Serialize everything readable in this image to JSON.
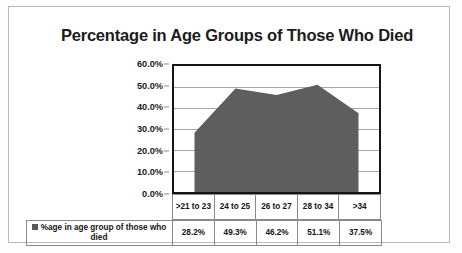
{
  "chart": {
    "title": "Percentage in Age Groups of Those Who Died",
    "legend_label": "%age in age group of those who died",
    "legend_swatch_color": "#5a5a5a",
    "area_fill_color": "#5e5e5e",
    "plot_border_color": "#151515",
    "gridline_color": "#a8a8a8"
  },
  "chart_data": {
    "type": "area",
    "title": "Percentage in Age Groups of Those Who Died",
    "xlabel": "",
    "ylabel": "",
    "categories": [
      ">21 to 23",
      "24 to 25",
      "26 to 27",
      "28 to 34",
      ">34"
    ],
    "values": [
      28.2,
      49.3,
      46.2,
      51.1,
      37.5
    ],
    "value_labels": [
      "28.2%",
      "49.3%",
      "46.2%",
      "51.1%",
      "37.5%"
    ],
    "series": [
      {
        "name": "%age in age group of those who died",
        "values": [
          28.2,
          49.3,
          46.2,
          51.1,
          37.5
        ]
      }
    ],
    "ylim": [
      0,
      60
    ],
    "ytick_labels": [
      "60.0%",
      "50.0%",
      "40.0%",
      "30.0%",
      "20.0%",
      "10.0%",
      "0.0%"
    ],
    "ytick_values": [
      60,
      50,
      40,
      30,
      20,
      10,
      0
    ],
    "grid": true,
    "legend_position": "data-table-bottom",
    "has_data_table": true
  },
  "ticks": {
    "t0": "60.0%",
    "t1": "50.0%",
    "t2": "40.0%",
    "t3": "30.0%",
    "t4": "20.0%",
    "t5": "10.0%",
    "t6": "0.0%"
  },
  "categories": {
    "c0": ">21 to 23",
    "c1": "24 to 25",
    "c2": "26 to 27",
    "c3": "28 to 34",
    "c4": ">34"
  },
  "values": {
    "v0": "28.2%",
    "v1": "49.3%",
    "v2": "46.2%",
    "v3": "51.1%",
    "v4": "37.5%"
  }
}
